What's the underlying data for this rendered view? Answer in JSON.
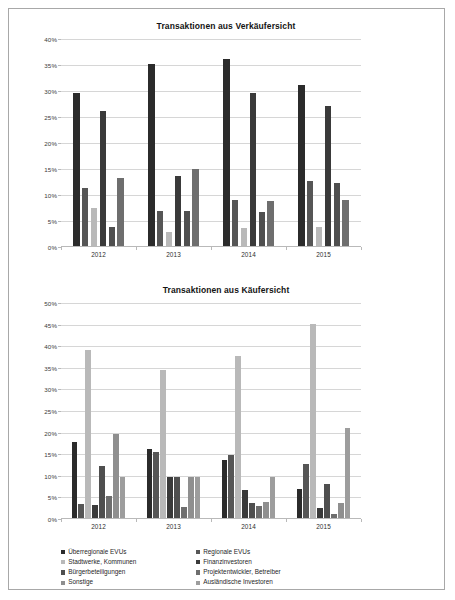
{
  "document": {
    "border_color": "#a8a8a8",
    "background": "#ffffff"
  },
  "legend": {
    "columns": [
      [
        "Überregionale EVUs",
        "Stadtwerke, Kommunen",
        "Bürgerbeteiligungen",
        "Sonstige"
      ],
      [
        "Regionale EVUs",
        "Finanzinvestoren",
        "Projektentwickler, Betreiber",
        "Ausländische Investoren"
      ]
    ],
    "colors_by_column": [
      [
        "#2b2b2b",
        "#b9b9b9",
        "#4f4f4f",
        "#8f8f8f"
      ],
      [
        "#565656",
        "#3a3a3a",
        "#6e6e6e",
        "#9d9d9d"
      ]
    ]
  },
  "series_names": [
    "Überregionale EVUs",
    "Regionale EVUs",
    "Stadtwerke, Kommunen",
    "Finanzinvestoren",
    "Bürgerbeteiligungen",
    "Projektentwickler, Betreiber",
    "Sonstige",
    "Ausländische Investoren"
  ],
  "series_colors": [
    "#2b2b2b",
    "#565656",
    "#b9b9b9",
    "#3a3a3a",
    "#4f4f4f",
    "#6e6e6e",
    "#8f8f8f",
    "#9d9d9d"
  ],
  "chart_data": [
    {
      "id": "chart1",
      "type": "bar",
      "title": "Transaktionen aus Verkäufersicht",
      "xlabel": "",
      "ylabel": "",
      "ylim": [
        0,
        40
      ],
      "ytick_values": [
        0,
        5,
        10,
        15,
        20,
        25,
        30,
        35,
        40
      ],
      "ytick_labels": [
        "0%",
        "5%",
        "10%",
        "15%",
        "20%",
        "25%",
        "30%",
        "35%",
        "40%"
      ],
      "grid": true,
      "legend_position": "bottom",
      "categories": [
        "2012",
        "2013",
        "2014",
        "2015"
      ],
      "series": [
        {
          "name": "Überregionale EVUs",
          "values": [
            29.5,
            35.0,
            36.0,
            31.0
          ]
        },
        {
          "name": "Regionale EVUs",
          "values": [
            11.2,
            6.8,
            8.8,
            12.5
          ]
        },
        {
          "name": "Stadtwerke, Kommunen",
          "values": [
            7.3,
            2.7,
            3.5,
            3.6
          ]
        },
        {
          "name": "Finanzinvestoren",
          "values": [
            26.0,
            13.5,
            29.5,
            27.0
          ]
        },
        {
          "name": "Bürgerbeteiligungen",
          "values": [
            3.7,
            6.8,
            6.5,
            12.2
          ]
        },
        {
          "name": "Projektentwickler, Betreiber",
          "values": [
            13.0,
            14.9,
            8.6,
            8.8
          ]
        }
      ]
    },
    {
      "id": "chart2",
      "type": "bar",
      "title": "Transaktionen aus Käufersicht",
      "xlabel": "",
      "ylabel": "",
      "ylim": [
        0,
        50
      ],
      "ytick_values": [
        0,
        5,
        10,
        15,
        20,
        25,
        30,
        35,
        40,
        45,
        50
      ],
      "ytick_labels": [
        "0%",
        "5%",
        "10%",
        "15%",
        "20%",
        "25%",
        "30%",
        "35%",
        "40%",
        "45%",
        "50%"
      ],
      "grid": true,
      "legend_position": "bottom",
      "categories": [
        "2012",
        "2013",
        "2014",
        "2015"
      ],
      "series": [
        {
          "name": "Überregionale EVUs",
          "values": [
            17.5,
            16.0,
            13.5,
            6.7
          ]
        },
        {
          "name": "Regionale EVUs",
          "values": [
            3.2,
            15.2,
            14.5,
            12.5
          ]
        },
        {
          "name": "Stadtwerke, Kommunen",
          "values": [
            39.0,
            34.2,
            37.5,
            45.0
          ]
        },
        {
          "name": "Finanzinvestoren",
          "values": [
            3.0,
            9.5,
            6.5,
            2.3
          ]
        },
        {
          "name": "Bürgerbeteiligungen",
          "values": [
            12.0,
            9.6,
            3.5,
            7.8
          ]
        },
        {
          "name": "Projektentwickler, Betreiber",
          "values": [
            5.0,
            2.5,
            2.8,
            1.0
          ]
        },
        {
          "name": "Sonstige",
          "values": [
            19.5,
            9.6,
            3.6,
            3.4
          ]
        },
        {
          "name": "Ausländische Investoren",
          "values": [
            9.6,
            9.6,
            9.5,
            20.8
          ]
        }
      ]
    }
  ]
}
